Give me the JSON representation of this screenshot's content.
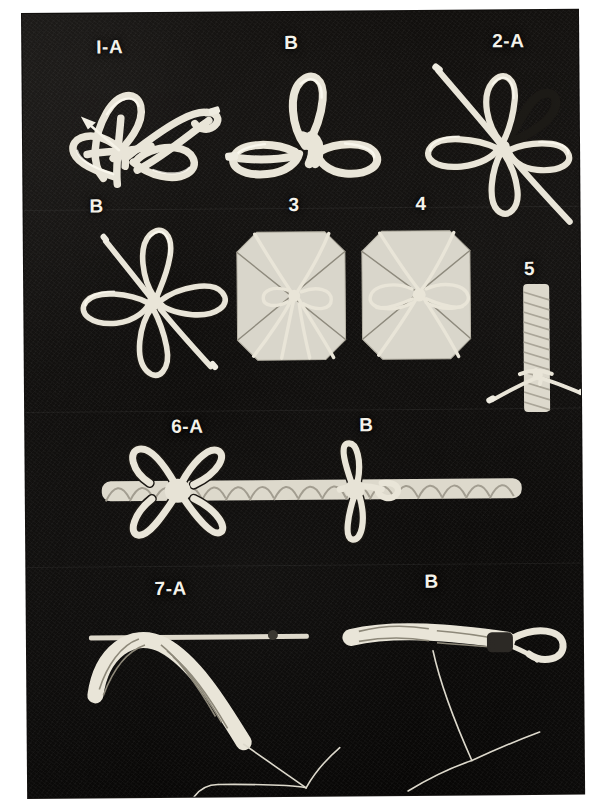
{
  "plate": {
    "title": "Decorative cord knot tying sequence photo plate",
    "background_color": "#0a0908",
    "border_color": "#ffffff",
    "cord_color": "#e9e5d8",
    "label_color": "#f4f2ea",
    "medium": "black-and-white photograph"
  },
  "figures": [
    {
      "id": "fig-1a",
      "label": "I-A",
      "caption": "I-A",
      "description": "Cord formed into a loose looped bow with a pulling arrow indicating direction",
      "has_arrow": true
    },
    {
      "id": "fig-1b",
      "label": "B",
      "caption": "B",
      "description": "Finished three-loop bow knot with two side loops and one upright loop"
    },
    {
      "id": "fig-2a",
      "label": "2-A",
      "caption": "2-A",
      "description": "Four-loop rosette knot with two running cord ends crossing diagonally"
    },
    {
      "id": "fig-2b",
      "label": "B",
      "caption": "B",
      "description": "Completed four-loop rosette knot with straight cord ends"
    },
    {
      "id": "fig-3",
      "label": "3",
      "caption": "3",
      "description": "Octagonal wrapped package tied with cord gathered at the centre"
    },
    {
      "id": "fig-4",
      "label": "4",
      "caption": "4",
      "description": "Octagonal wrapped package finished with a decorative bow at the centre"
    },
    {
      "id": "fig-5",
      "label": "5",
      "caption": "5",
      "description": "Cord-wrapped cylindrical rod with a tie knot near the lower end"
    },
    {
      "id": "fig-6a",
      "label": "6-A",
      "caption": "6-A",
      "description": "Twisted rope with a four-loop decorative bow tied at the left"
    },
    {
      "id": "fig-6b",
      "label": "B",
      "caption": "B",
      "description": "Same rope with a smaller two-loop bow tied at the centre"
    },
    {
      "id": "fig-7a",
      "label": "7-A",
      "caption": "7-A",
      "description": "Braided cord whipped over a rod with loose working strands hanging below"
    },
    {
      "id": "fig-7b",
      "label": "B",
      "caption": "B",
      "description": "Braided cord finished with an eye splice loop and trailing strands"
    }
  ]
}
